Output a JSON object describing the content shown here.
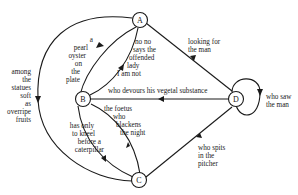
{
  "diagram": {
    "type": "directed-graph",
    "nodes": [
      {
        "id": "A",
        "label": "A"
      },
      {
        "id": "B",
        "label": "B"
      },
      {
        "id": "C",
        "label": "C"
      },
      {
        "id": "D",
        "label": "D"
      }
    ],
    "edges": [
      {
        "from": "A",
        "to": "C",
        "lines": [
          "among",
          "the",
          "statues",
          "soft",
          "as",
          "overripe",
          "fruits"
        ]
      },
      {
        "from": "A",
        "to": "B",
        "lines": [
          "a",
          "pearl",
          "oyster",
          "on",
          "the",
          "plate"
        ]
      },
      {
        "from": "B",
        "to": "A",
        "lines": [
          "no no",
          "says the",
          "offended",
          "lady",
          "I am not"
        ]
      },
      {
        "from": "A",
        "to": "D",
        "lines": [
          "looking for",
          "the man"
        ]
      },
      {
        "from": "D",
        "to": "B",
        "lines": [
          "who devours his vegetal substance"
        ]
      },
      {
        "from": "D",
        "to": "D",
        "lines": [
          "who saw",
          "the man"
        ]
      },
      {
        "from": "B",
        "to": "C",
        "lines": [
          "has only",
          "to kneel",
          "before a",
          "caterpillar"
        ]
      },
      {
        "from": "C",
        "to": "B",
        "lines": [
          "the foetus",
          "who",
          "blackens",
          "the night"
        ]
      },
      {
        "from": "D",
        "to": "C",
        "lines": [
          "who spits",
          "in the",
          "pitcher"
        ]
      }
    ]
  }
}
